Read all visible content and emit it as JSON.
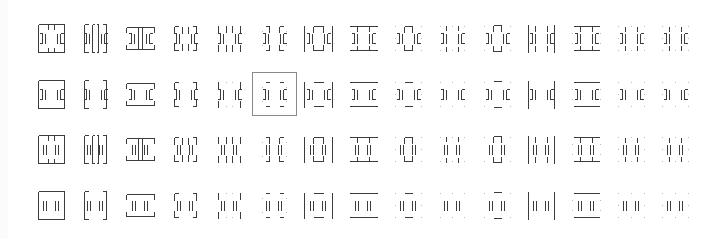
{
  "glyph_picker": {
    "columns": 15,
    "rows": 4,
    "selected": {
      "row": 1,
      "col": 5
    },
    "stroke_color": "#3c3c3c",
    "selection_border_color": "#8a8a8a",
    "rows_data": [
      {
        "inner": "bracket",
        "variant": "framed-ticks"
      },
      {
        "inner": "bracket",
        "variant": "framed"
      },
      {
        "inner": "double-bar",
        "variant": "framed-ticks"
      },
      {
        "inner": "double-bar",
        "variant": "framed"
      }
    ],
    "column_styles": [
      "full-box",
      "split-box",
      "top-bottom-notched",
      "split-notched",
      "side-ticks",
      "split-ticks-dots",
      "side-bars-cap",
      "top-bottom-bars",
      "center-cap-dots",
      "dots-only-bars",
      "center-cap-dots-light",
      "side-bars-tall",
      "top-bottom-bars-light",
      "dots-ticks",
      "dots-ticks-end"
    ]
  }
}
